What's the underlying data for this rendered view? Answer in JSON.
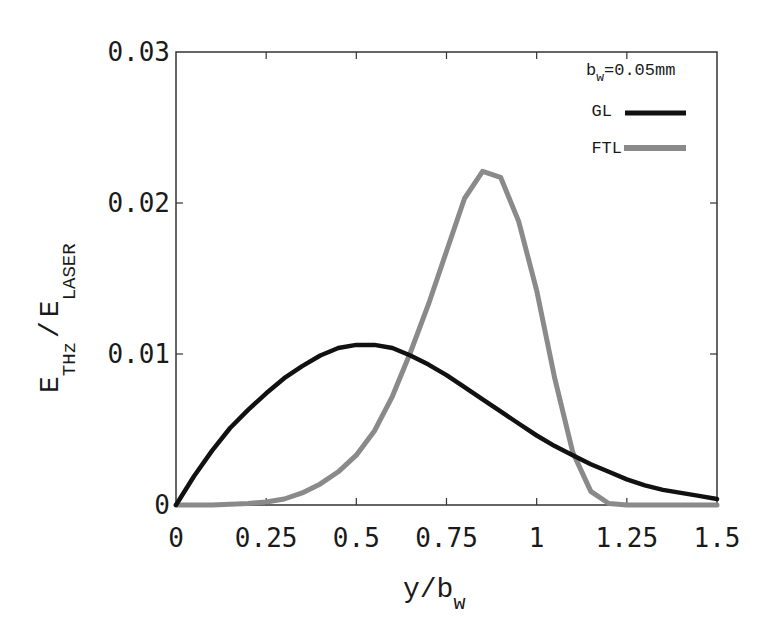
{
  "chart_data": {
    "type": "line",
    "title": "",
    "xlabel": "y/b_w",
    "ylabel": "E_THz / E_LASER",
    "xlim": [
      0,
      1.5
    ],
    "ylim": [
      0,
      0.03
    ],
    "grid": false,
    "legend_position": "upper right",
    "xticks": [
      "0",
      "0.25",
      "0.5",
      "0.75",
      "1",
      "1.25",
      "1.5"
    ],
    "yticks": [
      "0",
      "0.01",
      "0.02",
      "0.03"
    ],
    "annotations": [
      "b_w=0.05mm"
    ],
    "series": [
      {
        "name": "GL",
        "color": "#111111",
        "x": [
          0,
          0.05,
          0.1,
          0.15,
          0.2,
          0.25,
          0.3,
          0.35,
          0.4,
          0.45,
          0.5,
          0.55,
          0.6,
          0.65,
          0.7,
          0.75,
          0.8,
          0.85,
          0.9,
          0.95,
          1.0,
          1.05,
          1.1,
          1.15,
          1.2,
          1.25,
          1.3,
          1.35,
          1.4,
          1.45,
          1.5
        ],
        "y": [
          0,
          0.0019,
          0.0036,
          0.0051,
          0.0063,
          0.0074,
          0.0084,
          0.0092,
          0.0099,
          0.0104,
          0.0106,
          0.0106,
          0.0104,
          0.0099,
          0.0093,
          0.0086,
          0.0078,
          0.007,
          0.0062,
          0.0054,
          0.0046,
          0.0039,
          0.0033,
          0.0027,
          0.0022,
          0.0017,
          0.0013,
          0.001,
          0.0008,
          0.0006,
          0.0004
        ]
      },
      {
        "name": "FTL",
        "color": "#8a8a8a",
        "x": [
          0,
          0.1,
          0.2,
          0.25,
          0.3,
          0.35,
          0.4,
          0.45,
          0.5,
          0.55,
          0.6,
          0.65,
          0.7,
          0.75,
          0.8,
          0.85,
          0.9,
          0.95,
          1.0,
          1.05,
          1.1,
          1.15,
          1.2,
          1.25,
          1.3,
          1.4,
          1.5
        ],
        "y": [
          0,
          0,
          0.0001,
          0.0002,
          0.0004,
          0.0008,
          0.0014,
          0.0022,
          0.0033,
          0.0049,
          0.0072,
          0.0101,
          0.0133,
          0.0168,
          0.0203,
          0.0221,
          0.0217,
          0.0188,
          0.0142,
          0.0084,
          0.0035,
          0.0009,
          0.0001,
          0,
          0,
          0,
          0
        ]
      }
    ]
  },
  "legend": {
    "annotation_main": "b",
    "annotation_sub": "w",
    "annotation_value": "=0.05mm",
    "items": [
      {
        "label": "GL",
        "color": "#111111"
      },
      {
        "label": "FTL",
        "color": "#8a8a8a"
      }
    ]
  },
  "axes": {
    "xlabel_main": "y/b",
    "xlabel_sub": "w",
    "ylabel_e1": "E",
    "ylabel_sub1": "THz",
    "ylabel_slash": "/",
    "ylabel_e2": "E",
    "ylabel_sub2": "LASER"
  }
}
